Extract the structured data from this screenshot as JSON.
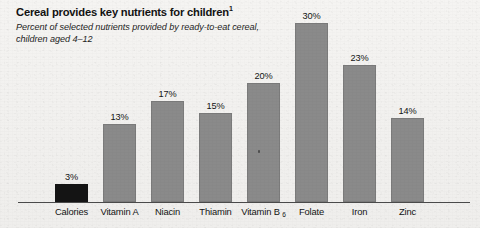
{
  "figure": {
    "title": "Cereal provides key nutrients for children",
    "title_superscript": "1",
    "subtitle": "Percent of selected nutrients provided by ready-to-eat cereal, children aged 4–12"
  },
  "colors": {
    "bar_gray": "#8a8a8a",
    "bar_dark": "#141414",
    "axis": "#4a4a4a",
    "background": "#f2f1ef",
    "text": "#141414"
  },
  "chart_data": {
    "type": "bar",
    "title": "Cereal provides key nutrients for children",
    "subtitle": "Percent of selected nutrients provided by ready-to-eat cereal, children aged 4–12",
    "xlabel": "",
    "ylabel": "",
    "ylim": [
      0,
      30
    ],
    "grid": false,
    "legend": "none",
    "categories": [
      "Calories",
      "Vitamin A",
      "Niacin",
      "Thiamin",
      "Vitamin B6",
      "Folate",
      "Iron",
      "Zinc"
    ],
    "category_labels": [
      "Calories",
      "Vitamin A",
      "Niacin",
      "Thiamin",
      "Vitamin B",
      "Folate",
      "Iron",
      "Zinc"
    ],
    "values": [
      3,
      13,
      17,
      15,
      20,
      30,
      23,
      14
    ],
    "value_labels": [
      "3%",
      "13%",
      "17%",
      "15%",
      "20%",
      "30%",
      "23%",
      "14%"
    ],
    "bar_colors": [
      "#141414",
      "#8a8a8a",
      "#8a8a8a",
      "#8a8a8a",
      "#8a8a8a",
      "#8a8a8a",
      "#8a8a8a",
      "#8a8a8a"
    ],
    "subscripts": [
      "",
      "",
      "",
      "",
      "6",
      "",
      "",
      ""
    ]
  }
}
